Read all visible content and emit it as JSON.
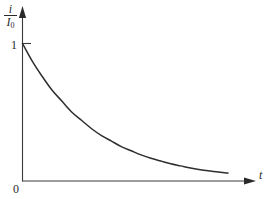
{
  "figure": {
    "background_color": "#ffffff",
    "line_color": "#2e2e2e",
    "axis_color": "#3a3a3a"
  },
  "labels": {
    "y_axis_numerator": "i",
    "y_axis_denominator": "I",
    "y_axis_denominator_sub": "0",
    "y_tick_one": "1",
    "origin": "0",
    "x_axis": "t"
  },
  "chart_data": {
    "type": "line",
    "title": "",
    "subtitle": "",
    "xlabel": "t",
    "ylabel": "i/I0",
    "xlim": [
      0,
      4.6
    ],
    "ylim": [
      0,
      1.12
    ],
    "grid": false,
    "legend": null,
    "x_tick_labels": [
      "0"
    ],
    "y_tick_labels": [
      "1"
    ],
    "y_ticks": [
      1
    ],
    "x_ticks": [
      0
    ],
    "annotations": [],
    "series": [
      {
        "name": "i/I0",
        "description": "exponential decay",
        "x": [
          0,
          0.2,
          0.4,
          0.6,
          0.8,
          1.0,
          1.2,
          1.4,
          1.6,
          1.8,
          2.0,
          2.2,
          2.4,
          2.6,
          2.8,
          3.0,
          3.2,
          3.4,
          3.6,
          3.8,
          4.0,
          4.16
        ],
        "values": [
          1.0,
          0.87,
          0.76,
          0.66,
          0.58,
          0.5,
          0.44,
          0.38,
          0.33,
          0.29,
          0.25,
          0.22,
          0.19,
          0.165,
          0.145,
          0.125,
          0.11,
          0.095,
          0.082,
          0.072,
          0.063,
          0.058
        ]
      }
    ]
  }
}
